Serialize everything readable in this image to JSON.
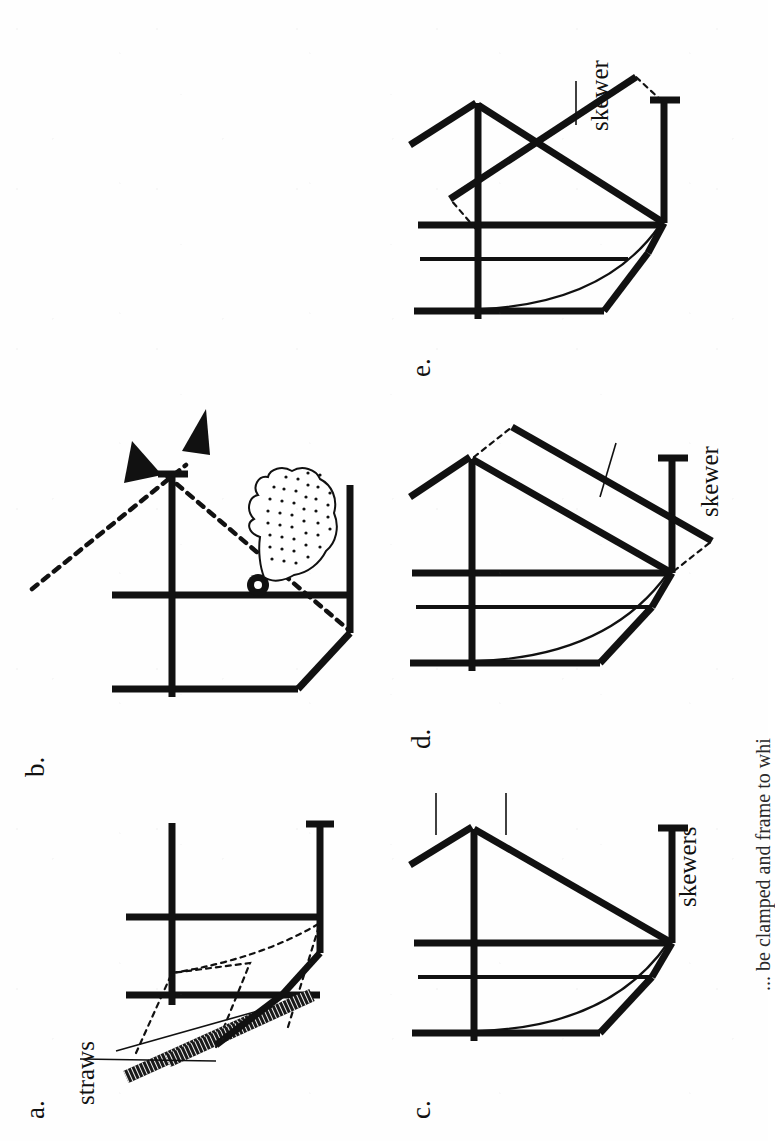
{
  "figure": {
    "orientation": "rotated-90-ccw",
    "background_color": "#fefefe",
    "ink_color": "#111111",
    "caption_partial": "... be clamped and frame to whi",
    "panel_count": 5
  },
  "panels": [
    {
      "id": "a",
      "label": "a.",
      "annotations": [
        {
          "name": "straws-label",
          "text": "straws"
        }
      ],
      "elements": [
        "vertical-frame-bar-left",
        "vertical-frame-bar-mid",
        "horizontal-cross-bar",
        "angled-bottom-bar",
        "clamp-tee-right",
        "two-parallel-straws",
        "dashed-construction-lines"
      ]
    },
    {
      "id": "b",
      "label": "b.",
      "annotations": [],
      "elements": [
        "vertical-frame-bar-left",
        "vertical-frame-bar-mid",
        "horizontal-cross-bar",
        "angled-bottom-bar",
        "clamp-tee-bottom",
        "dashed-pivot-line",
        "double-headed-arrow",
        "pointing-hand",
        "pivot-dot"
      ]
    },
    {
      "id": "c",
      "label": "c.",
      "annotations": [
        {
          "name": "skewers-label",
          "text": "skewers"
        }
      ],
      "elements": [
        "vertical-frame-bar-left",
        "vertical-frame-bar-mid-thin",
        "vertical-frame-bar-center",
        "horizontal-cross-bar",
        "angled-bottom-bar",
        "curved-arc",
        "skewer-upper-diagonal",
        "skewer-lower-diagonal",
        "clamp-tee-bottom",
        "leader-lines"
      ]
    },
    {
      "id": "d",
      "label": "d.",
      "annotations": [
        {
          "name": "skewer-label",
          "text": "skewer"
        }
      ],
      "elements": [
        "vertical-frame-bar-left",
        "vertical-frame-bar-mid-thin",
        "vertical-frame-bar-center",
        "horizontal-cross-bar",
        "angled-bottom-bar",
        "curved-arc",
        "skewer-upper-diagonal",
        "skewer-offset-parallel",
        "clamp-tee-bottom",
        "dashed-offset-links",
        "leader-line"
      ]
    },
    {
      "id": "e",
      "label": "e.",
      "annotations": [
        {
          "name": "skewer-label",
          "text": "skewer"
        }
      ],
      "elements": [
        "vertical-frame-bar-left",
        "vertical-frame-bar-mid-thin",
        "vertical-frame-bar-center",
        "horizontal-cross-bar",
        "angled-bottom-bar",
        "curved-arc",
        "skewer-upper-diagonal",
        "skewer-crossing-diagonal",
        "clamp-tee-bottom",
        "dashed-offset-links",
        "leader-line"
      ]
    }
  ]
}
